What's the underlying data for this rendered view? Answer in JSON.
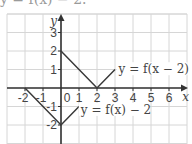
{
  "caption": "y = f(x) − 2.",
  "chart_data": {
    "type": "line",
    "title": "",
    "xlabel": "x",
    "ylabel": "y",
    "xlim": [
      -3,
      7
    ],
    "ylim": [
      -3,
      4
    ],
    "grid": true,
    "x_ticks": [
      "-2",
      "-1",
      "0",
      "1",
      "2",
      "3",
      "4",
      "5",
      "6"
    ],
    "y_ticks": [
      "3",
      "2",
      "1",
      "-1",
      "-2"
    ],
    "series": [
      {
        "name": "y = f(x − 2)",
        "points": [
          [
            0,
            2
          ],
          [
            2,
            0
          ],
          [
            3,
            1
          ]
        ]
      },
      {
        "name": "y = f(x) − 2",
        "points": [
          [
            -2,
            0
          ],
          [
            0,
            -2
          ],
          [
            1,
            -1
          ]
        ]
      }
    ],
    "annotations": [
      {
        "text": "y = f(x − 2)",
        "at": [
          3.2,
          0.8
        ]
      },
      {
        "text": "y = f(x) − 2",
        "at": [
          1.1,
          -1.4
        ]
      }
    ]
  },
  "labels": {
    "x_axis": "x",
    "y_axis": "y",
    "series1": "y = f(x − 2)",
    "series2": "y = f(x) − 2"
  },
  "colors": {
    "grid": "#d6d6d6",
    "axis": "#333333",
    "curve": "#3a3a3a",
    "text": "#444444"
  }
}
